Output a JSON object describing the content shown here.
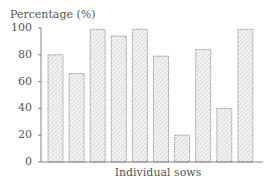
{
  "chart_data": {
    "type": "bar",
    "title": "",
    "xlabel": "Individual sows",
    "ylabel": "Percentage (%)",
    "ylim": [
      0,
      100
    ],
    "yticks": [
      0,
      20,
      40,
      60,
      80,
      100
    ],
    "grid": false,
    "legend": null,
    "categories": [
      "1",
      "2",
      "3",
      "4",
      "5",
      "6",
      "7",
      "8",
      "9",
      "10"
    ],
    "values": [
      80,
      66,
      99,
      94,
      99,
      79,
      20,
      84,
      40,
      99
    ],
    "bar_style": "hatched"
  },
  "colors": {
    "axis": "#666666",
    "bar_fill": "#f4f4f4",
    "bar_hatch": "#aaaaaa",
    "bar_border": "#888888",
    "text": "#555555"
  }
}
